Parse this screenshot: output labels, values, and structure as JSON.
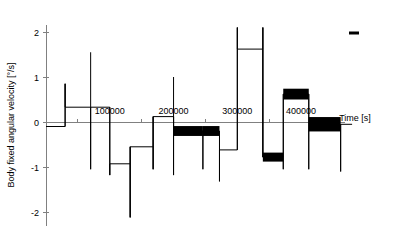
{
  "chart_data": {
    "type": "line",
    "title": "",
    "subtitle": "",
    "xlabel": "Time [s]",
    "ylabel": "Body fixed angular velocity [°/s]",
    "xlim": [
      -10000,
      520000
    ],
    "ylim": [
      -2.3,
      2.15
    ],
    "grid": false,
    "legend_position": "top-right",
    "legend": [
      {
        "label": "",
        "marker": "line-dash",
        "color": "#000000"
      }
    ],
    "y_ticks": [
      {
        "value": 2,
        "label": "2"
      },
      {
        "value": 1,
        "label": "1"
      },
      {
        "value": 0,
        "label": "0"
      },
      {
        "value": -1,
        "label": "-1"
      },
      {
        "value": -2,
        "label": "-2"
      }
    ],
    "x_ticks": [
      {
        "value": 100000,
        "label": "100000"
      },
      {
        "value": 200000,
        "label": "200000"
      },
      {
        "value": 300000,
        "label": "300000"
      },
      {
        "value": 400000,
        "label": "400000"
      }
    ],
    "x_minor_ticks": [
      50000,
      150000,
      250000,
      350000,
      450000
    ],
    "series": [
      {
        "name": "body fixed angular velocity",
        "color": "#000000",
        "style": "step",
        "note": "Piecewise-constant plateaus joined by near-vertical transitions with overshoot spikes; later plateaus carry thick high-frequency noise bands.",
        "segments": [
          {
            "x_start": 0,
            "x_end": 30000,
            "level": -0.1,
            "band": 0.04,
            "entry_spike": null,
            "exit_spike": 0.85
          },
          {
            "x_start": 30000,
            "x_end": 70000,
            "level": 0.33,
            "band": 0.03,
            "entry_spike": 0.85,
            "exit_spike": -1.05
          },
          {
            "x_start": 70000,
            "x_end": 100000,
            "level": 0.33,
            "band": 0.03,
            "entry_spike": 1.55,
            "exit_spike": -1.18
          },
          {
            "x_start": 100000,
            "x_end": 132000,
            "level": -0.93,
            "band": 0.04,
            "entry_spike": -1.18,
            "exit_spike": -2.12
          },
          {
            "x_start": 132000,
            "x_end": 168000,
            "level": -0.55,
            "band": 0.04,
            "entry_spike": -2.12,
            "exit_spike": -1.05
          },
          {
            "x_start": 168000,
            "x_end": 200000,
            "level": 0.12,
            "band": 0.03,
            "entry_spike": -1.05,
            "exit_spike": -1.18
          },
          {
            "x_start": 200000,
            "x_end": 246000,
            "level": -0.2,
            "band": 0.11,
            "entry_spike": 1.0,
            "exit_spike": -1.05
          },
          {
            "x_start": 246000,
            "x_end": 272000,
            "level": -0.2,
            "band": 0.11,
            "entry_spike": null,
            "exit_spike": -1.32
          },
          {
            "x_start": 272000,
            "x_end": 300000,
            "level": -0.62,
            "band": 0.05,
            "entry_spike": null,
            "exit_spike": 2.1
          },
          {
            "x_start": 300000,
            "x_end": 340000,
            "level": 1.62,
            "band": 0.05,
            "entry_spike": 2.1,
            "exit_spike": 2.1
          },
          {
            "x_start": 340000,
            "x_end": 372000,
            "level": -0.78,
            "band": 0.1,
            "entry_spike": 2.1,
            "exit_spike": -1.05
          },
          {
            "x_start": 372000,
            "x_end": 412000,
            "level": 0.62,
            "band": 0.12,
            "entry_spike": null,
            "exit_spike": -1.05
          },
          {
            "x_start": 412000,
            "x_end": 462000,
            "level": -0.05,
            "band": 0.16,
            "entry_spike": null,
            "exit_spike": -1.1
          },
          {
            "x_start": 462000,
            "x_end": 480000,
            "level": -0.05,
            "band": 0.05,
            "entry_spike": null,
            "exit_spike": null
          }
        ]
      }
    ]
  }
}
